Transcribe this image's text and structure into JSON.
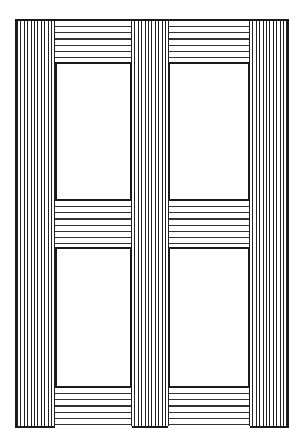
{
  "illustration": {
    "subject": "Wooden door/window frame with four panels",
    "colors": {
      "line": "#1a1a1a",
      "background": "#ffffff"
    },
    "stiles": [
      {
        "name": "left-stile",
        "x": 0,
        "w": 40
      },
      {
        "name": "center-mullion",
        "x": 115,
        "w": 38
      },
      {
        "name": "right-stile",
        "x": 233,
        "w": 41
      }
    ],
    "rails": [
      {
        "name": "top-rail",
        "y": 0,
        "h": 41
      },
      {
        "name": "middle-rail",
        "y": 180,
        "h": 46
      },
      {
        "name": "bottom-rail",
        "y": 367,
        "h": 42
      }
    ],
    "panels": [
      {
        "name": "panel-top-left",
        "x": 40,
        "y": 41,
        "w": 75,
        "h": 139
      },
      {
        "name": "panel-top-right",
        "x": 153,
        "y": 41,
        "w": 80,
        "h": 139
      },
      {
        "name": "panel-bottom-left",
        "x": 40,
        "y": 226,
        "w": 75,
        "h": 141
      },
      {
        "name": "panel-bottom-right",
        "x": 153,
        "y": 226,
        "w": 80,
        "h": 141
      }
    ]
  }
}
